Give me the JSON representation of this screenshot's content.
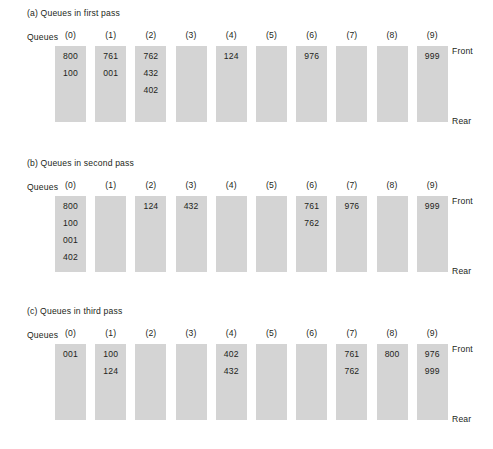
{
  "figure": {
    "column_headers": [
      "(0)",
      "(1)",
      "(2)",
      "(3)",
      "(4)",
      "(5)",
      "(6)",
      "(7)",
      "(8)",
      "(9)"
    ],
    "row_label": "Queues",
    "front_label": "Front",
    "rear_label": "Rear",
    "bar_color": "#d4d4d4",
    "text_color": "#231f20",
    "background": "#ffffff"
  },
  "panels": [
    {
      "caption": "(a) Queues in first pass",
      "queues": [
        [
          "800",
          "100"
        ],
        [
          "761",
          "001"
        ],
        [
          "762",
          "432",
          "402"
        ],
        [],
        [
          "124"
        ],
        [],
        [
          "976"
        ],
        [],
        [],
        [
          "999"
        ]
      ]
    },
    {
      "caption": "(b) Queues in second pass",
      "queues": [
        [
          "800",
          "100",
          "001",
          "402"
        ],
        [],
        [
          "124"
        ],
        [
          "432"
        ],
        [],
        [],
        [
          "761",
          "762"
        ],
        [
          "976"
        ],
        [],
        [
          "999"
        ]
      ]
    },
    {
      "caption": "(c) Queues in third pass",
      "queues": [
        [
          "001"
        ],
        [
          "100",
          "124"
        ],
        [],
        [],
        [
          "402",
          "432"
        ],
        [],
        [],
        [
          "761",
          "762"
        ],
        [
          "800"
        ],
        [
          "976",
          "999"
        ]
      ]
    }
  ]
}
